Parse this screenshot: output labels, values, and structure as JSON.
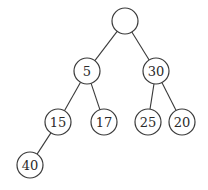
{
  "diagram": {
    "type": "binary-tree",
    "nodes": [
      {
        "id": "root",
        "label": "",
        "x": 125,
        "y": 21
      },
      {
        "id": "n5",
        "label": "5",
        "x": 87,
        "y": 71
      },
      {
        "id": "n30",
        "label": "30",
        "x": 156,
        "y": 71
      },
      {
        "id": "n15",
        "label": "15",
        "x": 58,
        "y": 122
      },
      {
        "id": "n17",
        "label": "17",
        "x": 104,
        "y": 122
      },
      {
        "id": "n25",
        "label": "25",
        "x": 148,
        "y": 122
      },
      {
        "id": "n20",
        "label": "20",
        "x": 182,
        "y": 122
      },
      {
        "id": "n40",
        "label": "40",
        "x": 30,
        "y": 165
      }
    ],
    "edges": [
      [
        "root",
        "n5"
      ],
      [
        "root",
        "n30"
      ],
      [
        "n5",
        "n15"
      ],
      [
        "n5",
        "n17"
      ],
      [
        "n30",
        "n25"
      ],
      [
        "n30",
        "n20"
      ],
      [
        "n15",
        "n40"
      ]
    ],
    "radius": 13
  }
}
